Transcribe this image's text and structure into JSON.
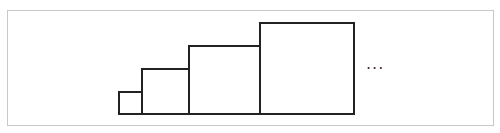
{
  "diagram": {
    "frame_color": "#c8c8c8",
    "stroke_color": "#222222",
    "squares": [
      {
        "x": 118,
        "y": 91,
        "w": 25,
        "h": 24
      },
      {
        "x": 141,
        "y": 68,
        "w": 49,
        "h": 47
      },
      {
        "x": 188,
        "y": 45,
        "w": 73,
        "h": 70
      },
      {
        "x": 259,
        "y": 22,
        "w": 96,
        "h": 93
      }
    ],
    "ellipsis": "..."
  }
}
